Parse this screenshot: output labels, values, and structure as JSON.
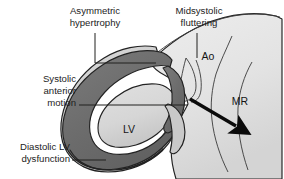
{
  "figure": {
    "width": 284,
    "height": 179,
    "background": "#ffffff"
  },
  "callouts": [
    {
      "id": "asymmetric-hypertrophy",
      "line1": "Asymmetric",
      "line2": "hypertrophy",
      "align": "middle"
    },
    {
      "id": "midsystolic-fluttering",
      "line1": "Midsystolic",
      "line2": "fluttering",
      "align": "middle"
    },
    {
      "id": "systolic-anterior-motion",
      "line1": "Systolic",
      "line2": "anterior",
      "line3": "motion",
      "align": "end"
    },
    {
      "id": "diastolic-lv-dysfunction",
      "line1": "Diastolic LV",
      "line2": "dysfunction",
      "align": "end"
    }
  ],
  "inline_labels": {
    "aorta": "Ao",
    "left_ventricle": "LV",
    "mitral_regurgitation": "MR"
  },
  "colors": {
    "myocardium_dark": "#6e6e6e",
    "myocardium_mid": "#8b8b8b",
    "cavity_light": "#d9d9d9",
    "aorta_light": "#e4e4e4",
    "epicardium_light": "#cfcfcf",
    "outline": "#222222",
    "arrow": "#0b0b0b",
    "text": "#1d1d1d",
    "background": "#ffffff"
  },
  "icons": {
    "flow_arrow": "mr-flow-arrow-icon"
  }
}
